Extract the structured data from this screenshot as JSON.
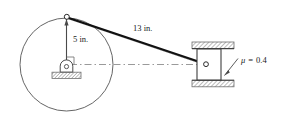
{
  "figure": {
    "type": "mechanism-diagram",
    "background_color": "#ffffff",
    "line_color": "#3a3a3a",
    "rod_color": "#111111",
    "hatch_color": "#9a9a9a",
    "text_color": "#1a1a1a"
  },
  "labels": {
    "crank_radius": "5 in.",
    "connecting_rod_length": "13 in.",
    "friction_coefficient": "μ = 0.4",
    "friction_symbol": "μ",
    "friction_value": "0.4",
    "friction_equals": "="
  },
  "geometry": {
    "wheel": {
      "center_x": 66.5,
      "center_y": 64.5,
      "radius": 46.5
    },
    "crank_pin_top": {
      "x": 66.5,
      "y": 18.0
    },
    "hub_pin": {
      "x": 66.5,
      "y": 64.5
    },
    "slider_pin": {
      "x": 206.0,
      "y": 64.0
    },
    "crank_line": {
      "x1": 66.5,
      "y1": 18.0,
      "x2": 66.5,
      "y2": 62.0
    },
    "rod_line": {
      "x1": 67.0,
      "y1": 17.0,
      "x2": 206.0,
      "y2": 64.0
    },
    "centerline": {
      "x1": 70.0,
      "y1": 64.5,
      "x2": 205.0,
      "y2": 64.5
    },
    "ground_base": {
      "x": 52.0,
      "y": 72.0,
      "width": 29.0,
      "height": 6.0
    },
    "guide_top": {
      "x": 192.0,
      "y": 42.0,
      "width": 42.0,
      "height": 6.5
    },
    "guide_bottom": {
      "x": 192.0,
      "y": 80.0,
      "width": 42.0,
      "height": 6.5
    },
    "slider_block": {
      "x": 197.0,
      "y": 49.0,
      "width": 24.0,
      "height": 31.0
    },
    "leader_line": {
      "x1": 224.0,
      "y1": 76.0,
      "x2": 237.0,
      "y2": 60.0
    }
  },
  "label_positions": {
    "crank_radius": {
      "x": 73.0,
      "y": 42.0
    },
    "rod_length": {
      "x": 133.0,
      "y": 31.0
    },
    "friction": {
      "x": 241.0,
      "y": 63.0
    }
  },
  "elements": {
    "wheel_name": "drive-wheel",
    "crank_name": "crank-arm",
    "rod_name": "connecting-rod",
    "pin_name": "crank-pin",
    "hub_name": "pin-support-bearing",
    "ground_name": "ground-hatching",
    "slider_name": "slider-block",
    "guide_name": "guide-rail",
    "centerline_name": "centerline"
  }
}
